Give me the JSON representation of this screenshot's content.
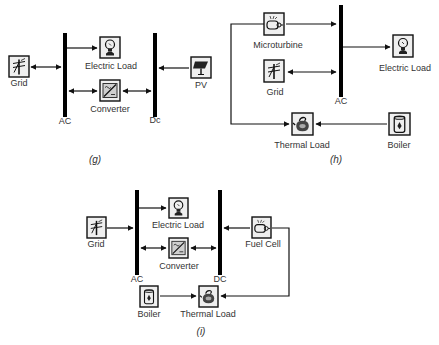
{
  "panels": {
    "g": {
      "caption": "(g)",
      "buses": {
        "ac": "AC",
        "dc": "Dc"
      },
      "components": {
        "grid": "Grid",
        "electric_load": "Electric Load",
        "converter": "Converter",
        "pv": "PV"
      }
    },
    "h": {
      "caption": "(h)",
      "buses": {
        "ac": "AC"
      },
      "components": {
        "microturbine": "Microturbine",
        "grid": "Grid",
        "electric_load": "Electric Load",
        "thermal_load": "Thermal Load",
        "boiler": "Boiler"
      }
    },
    "i": {
      "caption": "(i)",
      "buses": {
        "ac": "AC",
        "dc": "DC"
      },
      "components": {
        "grid": "Grid",
        "electric_load": "Electric Load",
        "converter": "Converter",
        "fuel_cell": "Fuel Cell",
        "boiler": "Boiler",
        "thermal_load": "Thermal Load"
      }
    }
  },
  "colors": {
    "line": "#111111",
    "bus": "#000000",
    "box_fill": "#efefef",
    "background": "#ffffff"
  }
}
